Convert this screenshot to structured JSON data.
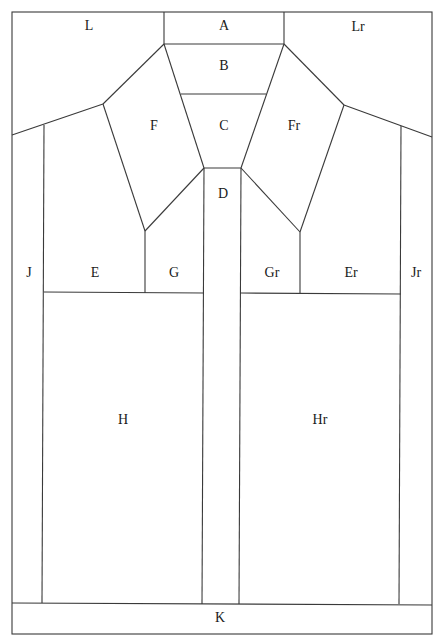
{
  "diagram": {
    "type": "shirt-pattern-layout",
    "stroke_color": "#3a3a3a",
    "background": "#ffffff",
    "pieces": [
      {
        "id": "L",
        "label": "L",
        "x": 89,
        "y": 27
      },
      {
        "id": "A",
        "label": "A",
        "x": 224,
        "y": 27
      },
      {
        "id": "Lr",
        "label": "Lr",
        "x": 358,
        "y": 28
      },
      {
        "id": "B",
        "label": "B",
        "x": 224,
        "y": 67
      },
      {
        "id": "C",
        "label": "C",
        "x": 224,
        "y": 127
      },
      {
        "id": "F",
        "label": "F",
        "x": 154,
        "y": 127
      },
      {
        "id": "Fr",
        "label": "Fr",
        "x": 294,
        "y": 127
      },
      {
        "id": "D",
        "label": "D",
        "x": 223,
        "y": 195
      },
      {
        "id": "J",
        "label": "J",
        "x": 29,
        "y": 274
      },
      {
        "id": "E",
        "label": "E",
        "x": 95,
        "y": 274
      },
      {
        "id": "G",
        "label": "G",
        "x": 174,
        "y": 274
      },
      {
        "id": "Gr",
        "label": "Gr",
        "x": 272,
        "y": 274
      },
      {
        "id": "Er",
        "label": "Er",
        "x": 351,
        "y": 274
      },
      {
        "id": "Jr",
        "label": "Jr",
        "x": 416,
        "y": 274
      },
      {
        "id": "H",
        "label": "H",
        "x": 123,
        "y": 421
      },
      {
        "id": "Hr",
        "label": "Hr",
        "x": 320,
        "y": 421
      },
      {
        "id": "K",
        "label": "K",
        "x": 220,
        "y": 619
      }
    ]
  }
}
